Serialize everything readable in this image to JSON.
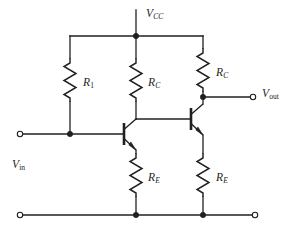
{
  "figure": {
    "kind": "circuit-schematic",
    "background_color": "#ffffff",
    "ink_color": "#231f20",
    "width": 291,
    "height": 230
  },
  "labels": {
    "supply": {
      "symbol": "V",
      "subscript": "CC",
      "subscript_style": "italic",
      "text": "VCC"
    },
    "output": {
      "symbol": "V",
      "subscript": "out",
      "subscript_style": "upright",
      "text": "Vout"
    },
    "input": {
      "symbol": "V",
      "subscript": "in",
      "subscript_style": "upright",
      "text": "Vin"
    },
    "r1": {
      "symbol": "R",
      "subscript": "1",
      "subscript_style": "upright",
      "text": "R1"
    },
    "rc_left": {
      "symbol": "R",
      "subscript": "C",
      "subscript_style": "italic",
      "text": "RC"
    },
    "rc_right": {
      "symbol": "R",
      "subscript": "C",
      "subscript_style": "italic",
      "text": "RC"
    },
    "re_left": {
      "symbol": "R",
      "subscript": "E",
      "subscript_style": "italic",
      "text": "RE"
    },
    "re_right": {
      "symbol": "R",
      "subscript": "E",
      "subscript_style": "italic",
      "text": "RE"
    }
  },
  "components": {
    "resistors": [
      {
        "name": "R1",
        "label_key": "r1",
        "orientation": "vertical",
        "x": 70,
        "y_top": 58,
        "y_bottom": 102
      },
      {
        "name": "RC-left",
        "label_key": "rc_left",
        "orientation": "vertical",
        "x": 136,
        "y_top": 58,
        "y_bottom": 102
      },
      {
        "name": "RC-right",
        "label_key": "rc_right",
        "orientation": "vertical",
        "x": 203,
        "y_top": 48,
        "y_bottom": 92
      },
      {
        "name": "RE-left",
        "label_key": "re_left",
        "orientation": "vertical",
        "x": 136,
        "y_top": 153,
        "y_bottom": 197
      },
      {
        "name": "RE-right",
        "label_key": "re_right",
        "orientation": "vertical",
        "x": 203,
        "y_top": 153,
        "y_bottom": 197
      }
    ],
    "transistors": [
      {
        "name": "Q1",
        "type": "npn",
        "base_side": "left",
        "base_x": 123,
        "base_y": 134
      },
      {
        "name": "Q2",
        "type": "npn",
        "base_side": "left",
        "base_x": 190,
        "base_y": 119
      }
    ],
    "terminals": [
      {
        "name": "vin-terminal",
        "x": 20,
        "y": 134,
        "style": "open-circle"
      },
      {
        "name": "vout-terminal",
        "x": 253,
        "y": 97,
        "style": "open-circle"
      },
      {
        "name": "gnd-left-terminal",
        "x": 20,
        "y": 215,
        "style": "open-circle"
      },
      {
        "name": "gnd-right-terminal",
        "x": 255,
        "y": 215,
        "style": "open-circle"
      }
    ],
    "junctions": [
      {
        "name": "vcc-node",
        "x": 136,
        "y": 36
      },
      {
        "name": "base-bias-node",
        "x": 70,
        "y": 134
      },
      {
        "name": "vout-node",
        "x": 203,
        "y": 97
      },
      {
        "name": "gnd-node-left",
        "x": 136,
        "y": 215
      },
      {
        "name": "gnd-node-right",
        "x": 203,
        "y": 215
      }
    ]
  }
}
